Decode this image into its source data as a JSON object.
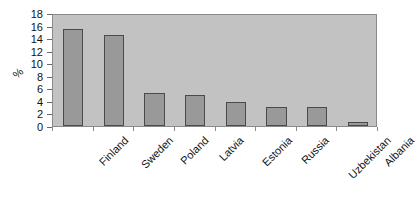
{
  "chart_data": {
    "type": "bar",
    "title": "",
    "xlabel": "",
    "ylabel": "%",
    "categories": [
      "Finland",
      "Sweden",
      "Poland",
      "Latvia",
      "Estonia",
      "Russia",
      "Uzbekistan",
      "Albania"
    ],
    "values": [
      15.5,
      14.5,
      5.2,
      4.9,
      3.8,
      3.1,
      3.1,
      0.6
    ],
    "ylim": [
      0,
      18
    ],
    "ytick_labels": [
      "0",
      "2",
      "4",
      "6",
      "8",
      "10",
      "12",
      "14",
      "16",
      "18"
    ],
    "ytick_values": [
      0,
      2,
      4,
      6,
      8,
      10,
      12,
      14,
      16,
      18
    ],
    "grid": false,
    "legend": "none",
    "bar_color": "#999999",
    "bar_edge_color": "#4a4a4a",
    "plot_background": "#c2c2c2",
    "plot_border_color": "#8a8a8a",
    "figure_background": "#ffffff",
    "axis_text_color": "#111111"
  }
}
